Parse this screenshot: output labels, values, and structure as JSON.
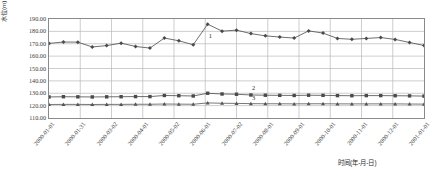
{
  "chart_data": {
    "type": "line",
    "title": "",
    "xlabel": "时间(年-月-日)",
    "ylabel": "水位(m)",
    "ylim": [
      110,
      190
    ],
    "ytick_labels": [
      "190.00",
      "180.00",
      "170.00",
      "160.00",
      "150.00",
      "140.00",
      "130.00",
      "120.00",
      "110.00"
    ],
    "ytick_values": [
      190,
      180,
      170,
      160,
      150,
      140,
      130,
      120,
      110
    ],
    "xtick_labels": [
      "2000-01-01",
      "2000-01-31",
      "2000-03-02",
      "2000-04-01",
      "2000-05-02",
      "2000-06-01",
      "2000-07-02",
      "2000-08-01",
      "2000-09-01",
      "2000-10-01",
      "2000-11-01",
      "2000-12-01",
      "2001-01-01"
    ],
    "grid": true,
    "legend_position": "inline-annotations",
    "annotations": [
      {
        "label": "1",
        "series": "1",
        "x_index": 11,
        "value": 172.5
      },
      {
        "label": "2",
        "series": "2",
        "x_index": 14,
        "value": 130.0
      },
      {
        "label": "3",
        "series": "3",
        "x_index": 14,
        "value": 122.0
      }
    ],
    "x": [
      "2000-01-01",
      "2000-01-16",
      "2000-01-31",
      "2000-02-15",
      "2000-03-02",
      "2000-03-17",
      "2000-04-01",
      "2000-04-16",
      "2000-05-02",
      "2000-05-17",
      "2000-06-01",
      "2000-06-16",
      "2000-06-26",
      "2000-07-02",
      "2000-07-09",
      "2000-07-17",
      "2000-08-01",
      "2000-08-16",
      "2000-09-01",
      "2000-09-16",
      "2000-10-01",
      "2000-10-16",
      "2000-11-01",
      "2000-11-16",
      "2000-12-01",
      "2000-12-16",
      "2001-01-01"
    ],
    "series": [
      {
        "name": "1",
        "marker": "diamond",
        "color": "#4a4a4a",
        "values": [
          170.3,
          171.4,
          171.3,
          167.4,
          168.5,
          170.5,
          167.8,
          166.5,
          174.6,
          172.4,
          169.2,
          185.8,
          180.2,
          181.0,
          178.2,
          176.4,
          175.4,
          174.6,
          180.4,
          178.6,
          174.3,
          173.6,
          174.3,
          175.0,
          173.5,
          171.0,
          168.6
        ]
      },
      {
        "name": "2",
        "marker": "square",
        "color": "#4a4a4a",
        "values": [
          127.0,
          127.2,
          127.1,
          127.0,
          127.1,
          127.2,
          127.3,
          127.3,
          128.2,
          128.0,
          127.8,
          130.0,
          129.4,
          129.2,
          128.6,
          128.4,
          128.3,
          128.2,
          128.4,
          128.3,
          128.1,
          128.0,
          128.1,
          128.1,
          128.0,
          127.9,
          127.7
        ]
      },
      {
        "name": "3",
        "marker": "triangle",
        "color": "#555555",
        "values": [
          120.9,
          121.0,
          121.0,
          120.9,
          121.0,
          121.0,
          121.1,
          121.1,
          121.3,
          121.2,
          121.1,
          122.2,
          121.9,
          121.8,
          121.6,
          121.5,
          121.5,
          121.4,
          121.5,
          121.5,
          121.4,
          121.4,
          121.4,
          121.4,
          121.4,
          121.3,
          121.2
        ]
      }
    ]
  }
}
